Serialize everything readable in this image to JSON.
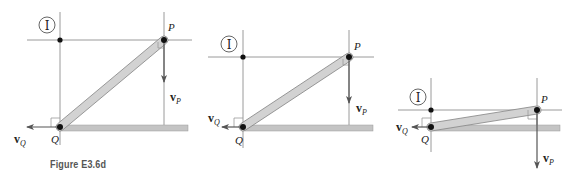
{
  "caption": "Figure E3.6d",
  "labels": {
    "ic": "I",
    "point_p": "P",
    "point_q": "Q",
    "vel_main": "v",
    "vel_p_sub": "P",
    "vel_q_sub": "Q"
  },
  "colors": {
    "line": "#9a9a9a",
    "bar_fill": "#d2d2d2",
    "bar_stroke": "#8a8a8a",
    "ground": "#c4c4c4",
    "ground_edge": "#9a9a9a",
    "dot": "#111111",
    "arrow": "#555555",
    "text": "#222222"
  },
  "figures": [
    {
      "ic": [
        60,
        40
      ],
      "q": [
        60,
        127
      ],
      "p": [
        164,
        40
      ],
      "h_line": [
        27,
        192
      ],
      "v_line_ic": [
        12,
        145
      ],
      "v_line_p": [
        12,
        125
      ],
      "ground": [
        60,
        188
      ],
      "vp_tip": 82,
      "vq_tip": 27,
      "circle_i": [
        47,
        25
      ],
      "p_label": [
        168,
        31
      ],
      "q_label": [
        51,
        143
      ],
      "vp_label": [
        170,
        101
      ],
      "vq_label": [
        14,
        143
      ]
    },
    {
      "ic": [
        243,
        57
      ],
      "q": [
        243,
        127
      ],
      "p": [
        349,
        57
      ],
      "h_line": [
        208,
        374
      ],
      "v_line_ic": [
        30,
        148
      ],
      "v_line_p": [
        30,
        125
      ],
      "ground": [
        243,
        373
      ],
      "vp_tip": 103,
      "vq_tip": 222,
      "circle_i": [
        229,
        44
      ],
      "p_label": [
        354,
        50
      ],
      "q_label": [
        235,
        144
      ],
      "vp_label": [
        356,
        112
      ],
      "vq_label": [
        208,
        122
      ]
    },
    {
      "ic": [
        431,
        110
      ],
      "q": [
        431,
        127
      ],
      "p": [
        537,
        110
      ],
      "h_line": [
        398,
        562
      ],
      "v_line_ic": [
        78,
        152
      ],
      "v_line_p": [
        78,
        125
      ],
      "ground": [
        431,
        560
      ],
      "vp_tip": 168,
      "vq_tip": 412,
      "circle_i": [
        418,
        97
      ],
      "p_label": [
        541,
        103
      ],
      "q_label": [
        421,
        143
      ],
      "vp_label": [
        543,
        162
      ],
      "vq_label": [
        396,
        131
      ]
    }
  ]
}
